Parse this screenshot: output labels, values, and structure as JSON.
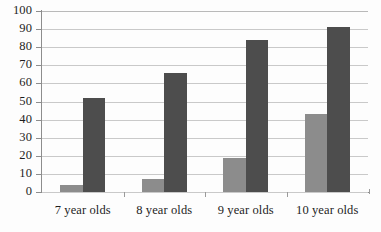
{
  "chart_data": {
    "type": "bar",
    "title": "",
    "subtitle": "",
    "xlabel": "",
    "ylabel": "",
    "categories": [
      "7 year olds",
      "8 year olds",
      "9 year olds",
      "10 year olds"
    ],
    "series": [
      {
        "name": "series-1",
        "color": "#8c8c8c",
        "values": [
          4,
          7,
          19,
          43
        ]
      },
      {
        "name": "series-2",
        "color": "#4d4d4d",
        "values": [
          52,
          66,
          84,
          91
        ]
      }
    ],
    "ylim": [
      0,
      100
    ],
    "yticks": [
      0,
      10,
      20,
      30,
      40,
      50,
      60,
      70,
      80,
      90,
      100
    ],
    "ytick_labels": [
      "0",
      "10",
      "20",
      "30",
      "40",
      "50",
      "60",
      "70",
      "80",
      "90",
      "100"
    ],
    "grid": true,
    "grid_axis": "y",
    "grid_color": "#c9c9c9",
    "legend": false,
    "legend_position": "none",
    "background_color": "#fdfdfd",
    "axis_color": "#8d8d8d",
    "annotations": []
  }
}
